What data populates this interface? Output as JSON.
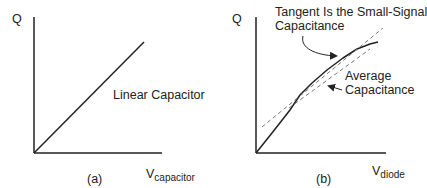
{
  "panels": [
    {
      "id": "a",
      "caption": "(a)",
      "y_axis_label": "Q",
      "x_axis_label_main": "V",
      "x_axis_label_sub": "capacitor",
      "annotation": "Linear Capacitor"
    },
    {
      "id": "b",
      "caption": "(b)",
      "y_axis_label": "Q",
      "x_axis_label_main": "V",
      "x_axis_label_sub": "diode",
      "annotation_tangent_line1": "Tangent Is the Small-Signal",
      "annotation_tangent_line2": "Capacitance",
      "annotation_average_line1": "Average",
      "annotation_average_line2": "Capacitance"
    }
  ],
  "colors": {
    "line": "#222222",
    "dashed": "#777777",
    "background": "#ffffff"
  }
}
